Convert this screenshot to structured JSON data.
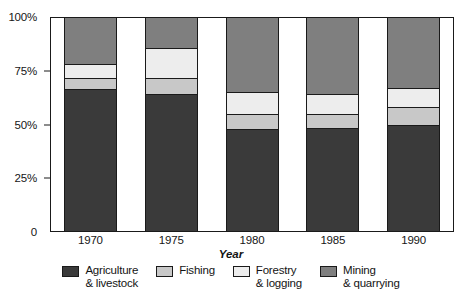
{
  "chart_data": {
    "type": "bar",
    "subtype": "stacked-bar-100-percent",
    "title": "",
    "xlabel": "Year",
    "ylabel": "",
    "categories": [
      "1970",
      "1975",
      "1980",
      "1985",
      "1990"
    ],
    "ylim": [
      0,
      100
    ],
    "ytick_labels": [
      "0",
      "25%",
      "50%",
      "75%",
      "100%"
    ],
    "ytick_values": [
      0,
      25,
      50,
      75,
      100
    ],
    "grid": false,
    "legend_position": "bottom",
    "stack_order_bottom_to_top": [
      "Agriculture & livestock",
      "Fishing",
      "Forestry & logging",
      "Mining & quarrying"
    ],
    "series": [
      {
        "name": "Agriculture & livestock",
        "color": "#3a3a3a",
        "values": [
          67,
          65,
          48,
          48.5,
          50
        ]
      },
      {
        "name": "Fishing",
        "color": "#c8c8c8",
        "values": [
          5,
          7,
          7,
          6.5,
          8
        ]
      },
      {
        "name": "Forestry & logging",
        "color": "#ededed",
        "values": [
          6,
          13.5,
          10,
          9,
          8.5
        ]
      },
      {
        "name": "Mining & quarrying",
        "color": "#7f7f7f",
        "values": [
          22,
          14.5,
          35,
          36,
          33.5
        ]
      }
    ]
  },
  "axis": {
    "y_ticks": [
      {
        "label": "100%",
        "value": 100
      },
      {
        "label": "75%",
        "value": 75
      },
      {
        "label": "50%",
        "value": 50
      },
      {
        "label": "25%",
        "value": 25
      },
      {
        "label": "0",
        "value": 0
      }
    ],
    "x_title": "Year",
    "x_ticks": [
      {
        "label": "1970"
      },
      {
        "label": "1975"
      },
      {
        "label": "1980"
      },
      {
        "label": "1985"
      },
      {
        "label": "1990"
      }
    ]
  },
  "legend": {
    "items": [
      {
        "label": "Agriculture\n& livestock",
        "color": "#3a3a3a"
      },
      {
        "label": "Fishing",
        "color": "#c8c8c8"
      },
      {
        "label": "Forestry\n& logging",
        "color": "#ededed"
      },
      {
        "label": "Mining\n& quarrying",
        "color": "#7f7f7f"
      }
    ]
  },
  "colors": {
    "agriculture": "#3a3a3a",
    "fishing": "#c8c8c8",
    "forestry": "#ededed",
    "mining": "#7f7f7f",
    "outline": "#1a1a1a",
    "background": "#ffffff"
  }
}
